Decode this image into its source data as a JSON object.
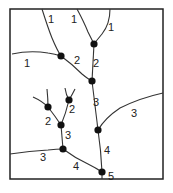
{
  "diagram": {
    "labels": [
      {
        "text": "1",
        "x": 48,
        "y": 23
      },
      {
        "text": "1",
        "x": 71,
        "y": 23
      },
      {
        "text": "1",
        "x": 108,
        "y": 31
      },
      {
        "text": "1",
        "x": 24,
        "y": 67
      },
      {
        "text": "2",
        "x": 74,
        "y": 64
      },
      {
        "text": "2",
        "x": 93,
        "y": 67
      },
      {
        "text": "3",
        "x": 93,
        "y": 106
      },
      {
        "text": "3",
        "x": 131,
        "y": 117
      },
      {
        "text": "2",
        "x": 69,
        "y": 113
      },
      {
        "text": "2",
        "x": 45,
        "y": 125
      },
      {
        "text": "3",
        "x": 65,
        "y": 139
      },
      {
        "text": "4",
        "x": 104,
        "y": 154
      },
      {
        "text": "3",
        "x": 40,
        "y": 161
      },
      {
        "text": "4",
        "x": 73,
        "y": 170
      },
      {
        "text": "5",
        "x": 108,
        "y": 180
      }
    ],
    "nodes": [
      {
        "x": 94,
        "y": 44
      },
      {
        "x": 61,
        "y": 56
      },
      {
        "x": 92,
        "y": 81
      },
      {
        "x": 48,
        "y": 107
      },
      {
        "x": 69,
        "y": 100
      },
      {
        "x": 61,
        "y": 125
      },
      {
        "x": 98,
        "y": 130
      },
      {
        "x": 63,
        "y": 149
      },
      {
        "x": 102,
        "y": 172
      }
    ]
  }
}
